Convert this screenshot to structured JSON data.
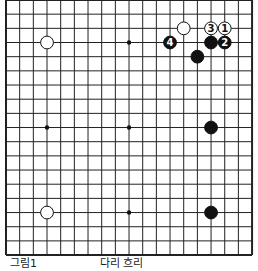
{
  "board": {
    "size": 19,
    "origin_x": 6,
    "origin_y": 0,
    "step_x": 13.67,
    "step_y": 14.17,
    "line_color": "#222222",
    "star_points": [
      [
        3,
        3
      ],
      [
        9,
        3
      ],
      [
        3,
        9
      ],
      [
        9,
        9
      ],
      [
        3,
        15
      ],
      [
        9,
        15
      ]
    ],
    "stones": [
      {
        "color": "white",
        "col": 3,
        "row": 3,
        "label": ""
      },
      {
        "color": "white",
        "col": 13,
        "row": 2,
        "label": ""
      },
      {
        "color": "white",
        "col": 15,
        "row": 2,
        "label": "3"
      },
      {
        "color": "white",
        "col": 16,
        "row": 2,
        "label": "1"
      },
      {
        "color": "black",
        "col": 12,
        "row": 3,
        "label": "4"
      },
      {
        "color": "black",
        "col": 15,
        "row": 3,
        "label": ""
      },
      {
        "color": "black",
        "col": 16,
        "row": 3,
        "label": "2"
      },
      {
        "color": "black",
        "col": 14,
        "row": 4,
        "label": ""
      },
      {
        "color": "black",
        "col": 15,
        "row": 9,
        "label": ""
      },
      {
        "color": "white",
        "col": 3,
        "row": 15,
        "label": ""
      },
      {
        "color": "black",
        "col": 15,
        "row": 15,
        "label": ""
      }
    ]
  },
  "caption": {
    "figure_label": "그림1",
    "text": "다리 흐리"
  }
}
